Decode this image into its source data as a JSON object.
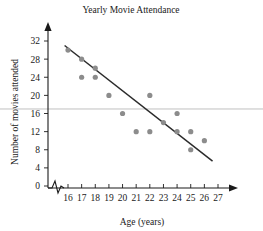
{
  "chart_data": {
    "type": "scatter",
    "title": "Yearly Movie Attendance",
    "xlabel": "Age (years)",
    "ylabel": "Number of movies attended",
    "xlim": [
      15.4,
      27.6
    ],
    "ylim": [
      0,
      33
    ],
    "xticks": [
      16,
      17,
      18,
      19,
      20,
      21,
      22,
      23,
      24,
      25,
      26,
      27
    ],
    "yticks": [
      0,
      4,
      8,
      12,
      16,
      20,
      24,
      28,
      32
    ],
    "grid": false,
    "legend": "none",
    "axis_break_x": true,
    "points": [
      {
        "x": 16,
        "y": 30
      },
      {
        "x": 17,
        "y": 28
      },
      {
        "x": 17,
        "y": 24
      },
      {
        "x": 18,
        "y": 26
      },
      {
        "x": 18,
        "y": 24
      },
      {
        "x": 19,
        "y": 20
      },
      {
        "x": 20,
        "y": 16
      },
      {
        "x": 21,
        "y": 12
      },
      {
        "x": 22,
        "y": 20
      },
      {
        "x": 22,
        "y": 12
      },
      {
        "x": 23,
        "y": 14
      },
      {
        "x": 24,
        "y": 16
      },
      {
        "x": 24,
        "y": 12
      },
      {
        "x": 25,
        "y": 12
      },
      {
        "x": 25,
        "y": 8
      },
      {
        "x": 26,
        "y": 10
      }
    ],
    "trend_line": {
      "name": "line of best fit",
      "x1": 15.75,
      "y1": 31.0,
      "x2": 26.6,
      "y2": 5.5,
      "color": "#2b2b2b"
    },
    "reference_line": {
      "name": "horizontal reference line",
      "y": 17.0,
      "color": "#b9b9b9"
    },
    "marker_color": "#8c8c8c"
  }
}
